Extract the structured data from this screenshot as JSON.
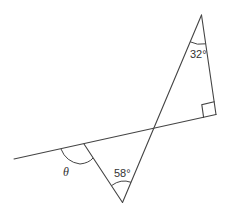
{
  "diagram": {
    "type": "geometry",
    "colors": {
      "stroke": "#444444",
      "text": "#333333",
      "background": "#ffffff"
    },
    "labels": {
      "top_angle": "32°",
      "bottom_angle": "58°",
      "unknown_angle": "θ"
    },
    "right_angle_marker": true,
    "points": {
      "top_apex": [
        201.5,
        15
      ],
      "right_angle_vertex": [
        216,
        114.5
      ],
      "line_left_end": [
        14,
        159
      ],
      "intersection": [
        153,
        128
      ],
      "theta_vertex": [
        84,
        144
      ],
      "bottom_apex": [
        122.5,
        202.5
      ]
    }
  }
}
